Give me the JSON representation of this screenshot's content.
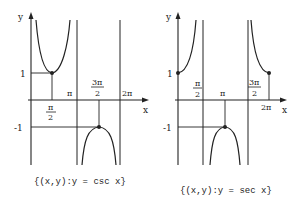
{
  "graphs": [
    {
      "id": "csc",
      "caption": "{(x,y):y = csc x}",
      "axis_labels": {
        "x": "x",
        "y": "y"
      },
      "y_ticks": {
        "pos": "1",
        "neg": "-1"
      },
      "x_ticks": {
        "half_pi_num": "π",
        "half_pi_den": "2",
        "pi": "π",
        "three_half_pi_num": "3π",
        "three_half_pi_den": "2",
        "two_pi": "2π"
      },
      "asymptotes": [
        "π",
        "2π"
      ],
      "marked_points": [
        "(π/2, 1)",
        "(3π/2, -1)"
      ]
    },
    {
      "id": "sec",
      "caption": "{(x,y):y = sec x}",
      "axis_labels": {
        "x": "x",
        "y": "y"
      },
      "y_ticks": {
        "pos": "1",
        "neg": "-1"
      },
      "x_ticks": {
        "half_pi_num": "π",
        "half_pi_den": "2",
        "pi": "π",
        "three_half_pi_num": "3π",
        "three_half_pi_den": "2",
        "two_pi": "2π"
      },
      "asymptotes": [
        "π/2",
        "3π/2"
      ],
      "marked_points": [
        "(0, 1)",
        "(π, -1)",
        "(2π, 1)"
      ]
    }
  ]
}
